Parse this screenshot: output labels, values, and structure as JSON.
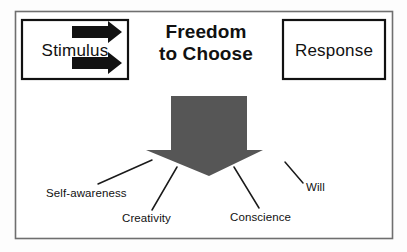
{
  "diagram": {
    "title_line1": "Freedom",
    "title_line2": "to Choose",
    "stimulus_label": "Stimulus",
    "response_label": "Response",
    "arrow_icon_top": "right-arrow-icon",
    "arrow_icon_bottom": "right-arrow-icon",
    "down_arrow_icon": "down-arrow-icon",
    "endowments": [
      {
        "label": "Self-awareness"
      },
      {
        "label": "Creativity"
      },
      {
        "label": "Conscience"
      },
      {
        "label": "Will"
      }
    ],
    "colors": {
      "frame_border": "#6f6f6f",
      "box_border": "#111111",
      "big_arrow_fill": "#565656",
      "stimulus_arrow_fill": "#121212",
      "text": "#111111",
      "background": "#fdfdfd"
    }
  }
}
